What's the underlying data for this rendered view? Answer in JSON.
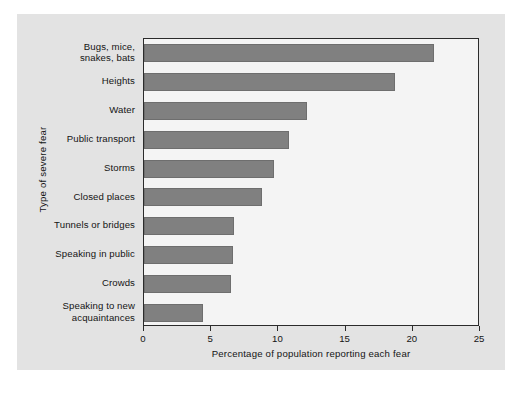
{
  "chart_data": {
    "type": "bar",
    "orientation": "horizontal",
    "title": "",
    "xlabel": "Percentage of population reporting each fear",
    "ylabel": "Type of severe fear",
    "xlim": [
      0,
      25
    ],
    "xticks": [
      0,
      5,
      10,
      15,
      20,
      25
    ],
    "xtick_labels": [
      "0",
      "5",
      "10",
      "15",
      "20",
      "25"
    ],
    "grid": false,
    "legend": null,
    "bar_color": "#808080",
    "categories": [
      "Bugs, mice,\nsnakes, bats",
      "Heights",
      "Water",
      "Public transport",
      "Storms",
      "Closed places",
      "Tunnels or bridges",
      "Speaking in public",
      "Crowds",
      "Speaking to new\nacquaintances"
    ],
    "category_lines": [
      [
        "Bugs, mice,",
        "snakes, bats"
      ],
      [
        "Heights"
      ],
      [
        "Water"
      ],
      [
        "Public transport"
      ],
      [
        "Storms"
      ],
      [
        "Closed places"
      ],
      [
        "Tunnels or bridges"
      ],
      [
        "Speaking in public"
      ],
      [
        "Crowds"
      ],
      [
        "Speaking to new",
        "acquaintances"
      ]
    ],
    "values": [
      21.6,
      18.7,
      12.1,
      10.8,
      9.7,
      8.8,
      6.7,
      6.6,
      6.5,
      4.4
    ]
  },
  "figure": {
    "background_color": "#e3e3e3",
    "plot_background_color": "#f4f4f4",
    "frame_color": "#2b2b2b"
  }
}
